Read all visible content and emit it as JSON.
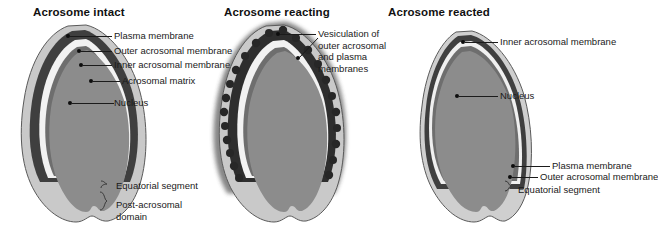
{
  "figure": {
    "background_color": "#ffffff",
    "text_color": "#1a1a1a",
    "panel_count": 3
  },
  "palette": {
    "plasma_membrane": "#c9c9c9",
    "outer_acrosomal_membrane": "#3f3f3f",
    "acrosomal_matrix": "#f2f2f2",
    "inner_acrosomal_membrane": "#6e6e6e",
    "nucleus": "#8c8c8c",
    "vesicle": "#2b2b2b",
    "leader_line": "#1b1b1b",
    "outline": "#555555"
  },
  "panels": [
    {
      "id": "acrosome-intact",
      "title": "Acrosome intact",
      "labels": [
        {
          "id": "plasma-membrane",
          "text": "Plasma membrane"
        },
        {
          "id": "outer-acrosomal-membrane",
          "text": "Outer acrosomal membrane"
        },
        {
          "id": "inner-acrosomal-membrane",
          "text": "Inner acrosomal membrane"
        },
        {
          "id": "acrosomal-matrix",
          "text": "Acrosomal matrix"
        },
        {
          "id": "nucleus",
          "text": "Nucleus"
        },
        {
          "id": "equatorial-segment",
          "text": "Equatorial segment"
        },
        {
          "id": "post-acrosomal-domain",
          "text": "Post-acrosomal domain"
        }
      ]
    },
    {
      "id": "acrosome-reacting",
      "title": "Acrosome reacting",
      "labels": [
        {
          "id": "vesiculation",
          "text": "Vesiculation of outer acrosomal and plasma membranes"
        }
      ]
    },
    {
      "id": "acrosome-reacted",
      "title": "Acrosome reacted",
      "labels": [
        {
          "id": "inner-acrosomal-membrane",
          "text": "Inner acrosomal membrane"
        },
        {
          "id": "nucleus",
          "text": "Nucleus"
        },
        {
          "id": "plasma-membrane",
          "text": "Plasma membrane"
        },
        {
          "id": "outer-acrosomal-membrane",
          "text": "Outer acrosomal membrane"
        },
        {
          "id": "equatorial-segment",
          "text": "Equatorial segment"
        }
      ]
    }
  ]
}
